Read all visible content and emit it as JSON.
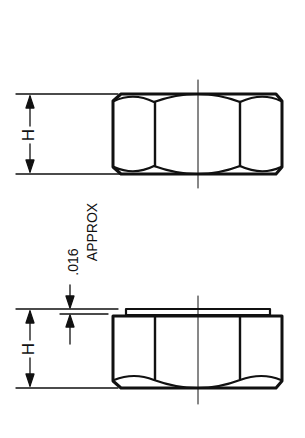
{
  "diagram": {
    "views": [
      {
        "name": "plain-hex-nut",
        "dimension_label": "H"
      },
      {
        "name": "hex-nut-with-washer-face",
        "dimension_label": "H"
      }
    ],
    "annotation": {
      "value": ".016",
      "note": "APPROX"
    },
    "colors": {
      "ink": "#111111",
      "background": "#ffffff"
    }
  }
}
